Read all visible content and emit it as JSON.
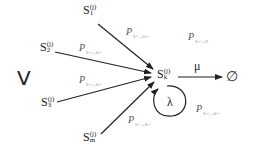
{
  "diagram": {
    "set_label": "V",
    "nodes": {
      "s1": {
        "base": "S",
        "sup": "(j)",
        "sub": "1"
      },
      "s2": {
        "base": "S",
        "sup": "(j)",
        "sub": "2"
      },
      "s3": {
        "base": "S",
        "sup": "(j)",
        "sub": "3"
      },
      "sm": {
        "base": "S",
        "sup": "(j)",
        "sub": "m"
      },
      "sk": {
        "base": "S",
        "sup": "(j)",
        "sub": "k"
      },
      "empty": "∅"
    },
    "rates": {
      "mu": "μ",
      "lambda": "λ"
    },
    "edge_labels": {
      "p_s1": {
        "base": "P",
        "sub": "Sᵢ⁽ʲ⁾→Sₖ⁽ʲ⁾"
      },
      "p_s2": {
        "base": "P",
        "sub": "Sᵢ⁽ʲ⁾→Sₖ⁽ʲ⁾"
      },
      "p_s3": {
        "base": "P",
        "sub": "Sᵢ⁽ʲ⁾→Sₖ⁽ʲ⁾"
      },
      "p_sm": {
        "base": "P",
        "sub": "Sᵢ⁽ʲ⁾→Sₖ⁽ʲ⁾"
      },
      "p_exit": {
        "base": "P",
        "sub": "Sₖ⁽ʲ⁾→∅"
      },
      "p_loop": {
        "base": "P",
        "sub": "Sₖ⁽ʲ⁾→Sₖ⁽ʲ⁾"
      }
    }
  }
}
